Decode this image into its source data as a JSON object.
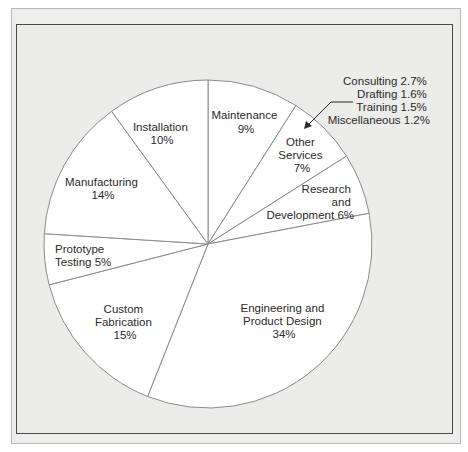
{
  "chart_data": {
    "type": "pie",
    "title": "",
    "start_angle_deg": 0,
    "direction": "clockwise",
    "slices": [
      {
        "label": "Maintenance",
        "value": 9,
        "label_lines": [
          "Maintenance",
          "9%"
        ]
      },
      {
        "label": "Other Services",
        "value": 7,
        "label_lines": [
          "Other",
          "Services",
          "7%"
        ]
      },
      {
        "label": "Research and Development",
        "value": 6,
        "label_lines": [
          "Research",
          "and",
          "Development 6%"
        ]
      },
      {
        "label": "Engineering and Product Design",
        "value": 34,
        "label_lines": [
          "Engineering and",
          "Product Design",
          "34%"
        ]
      },
      {
        "label": "Custom Fabrication",
        "value": 15,
        "label_lines": [
          "Custom",
          "Fabrication",
          "15%"
        ]
      },
      {
        "label": "Prototype Testing",
        "value": 5,
        "label_lines": [
          "Prototype",
          "Testing 5%"
        ]
      },
      {
        "label": "Manufacturing",
        "value": 14,
        "label_lines": [
          "Manufacturing",
          "14%"
        ]
      },
      {
        "label": "Installation",
        "value": 10,
        "label_lines": [
          "Installation",
          "10%"
        ]
      }
    ],
    "annotation": {
      "target": "Other Services",
      "lines": [
        "Consulting 2.7%",
        "Drafting 1.6%",
        "Training 1.5%",
        "Miscellaneous 1.2%"
      ],
      "breakdown": [
        {
          "label": "Consulting",
          "value": 2.7
        },
        {
          "label": "Drafting",
          "value": 1.6
        },
        {
          "label": "Training",
          "value": 1.5
        },
        {
          "label": "Miscellaneous",
          "value": 1.2
        }
      ]
    },
    "colors": {
      "slice_fill": "#ffffff",
      "slice_stroke": "#8a8a8a",
      "background": "#ececea",
      "text": "#2b2b2b"
    }
  }
}
